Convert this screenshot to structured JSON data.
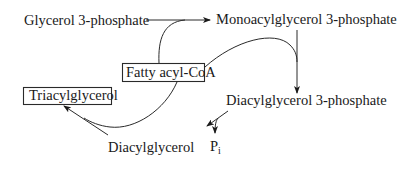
{
  "diagram": {
    "nodes": {
      "glycerol3p": "Glycerol 3-phosphate",
      "monoacyl3p": "Monoacylglycerol 3-phosphate",
      "fattyacylcoa": "Fatty acyl-CoA",
      "diacyl3p": "Diacylglycerol 3-phosphate",
      "diacylglycerol": "Diacylglycerol",
      "triacylglycerol": "Triacylglycerol",
      "pi_main": "P",
      "pi_sub": "i"
    },
    "edges": [
      {
        "from": "Glycerol 3-phosphate",
        "to": "Monoacylglycerol 3-phosphate",
        "cofactor": "Fatty acyl-CoA"
      },
      {
        "from": "Monoacylglycerol 3-phosphate",
        "to": "Diacylglycerol 3-phosphate",
        "cofactor": "Fatty acyl-CoA"
      },
      {
        "from": "Diacylglycerol 3-phosphate",
        "to": "Diacylglycerol",
        "byproduct": "Pi"
      },
      {
        "from": "Diacylglycerol",
        "to": "Triacylglycerol",
        "cofactor": "Fatty acyl-CoA"
      }
    ]
  }
}
